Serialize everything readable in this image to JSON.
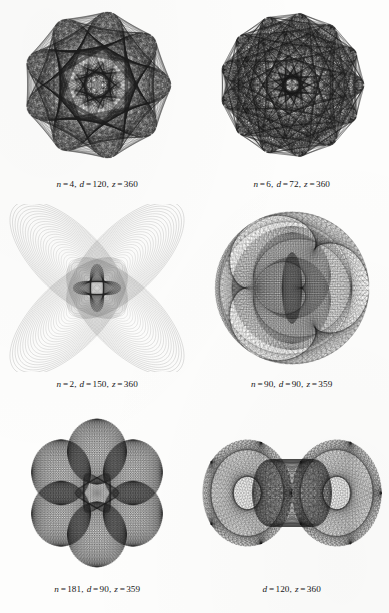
{
  "page": {
    "kind": "figure-plate",
    "background_color": "#fdfdfc",
    "ink_color": "#1a1a1a",
    "columns": 2,
    "rows": 3
  },
  "figures": [
    {
      "id": "figure-1",
      "name": "nine-petal-rosette",
      "caption_parts": {
        "n_label": "n",
        "n_value": "4",
        "d_label": "d",
        "d_value": "120",
        "z_label": "z",
        "z_value": "360"
      },
      "caption_text": "n = 4,  d = 120,  z = 360",
      "params": {
        "n": 4,
        "d": 120,
        "z": 360
      },
      "render": {
        "type": "spirograph-rose",
        "lobes": 9,
        "steps": 360,
        "radius": 74,
        "inner": 0.34,
        "stroke": "#1e1e1e",
        "stroke_width": 0.33,
        "opacity": 0.55,
        "variant": "petal"
      }
    },
    {
      "id": "figure-2",
      "name": "thirteen-point-star",
      "caption_parts": {
        "n_label": "n",
        "n_value": "6",
        "d_label": "d",
        "d_value": "72",
        "z_label": "z",
        "z_value": "360"
      },
      "caption_text": "n = 6,  d = 72,  z = 360",
      "params": {
        "n": 6,
        "d": 72,
        "z": 360
      },
      "render": {
        "type": "spirograph-star",
        "lobes": 13,
        "steps": 360,
        "radius": 72,
        "inner": 0.3,
        "stroke": "#1c1c1c",
        "stroke_width": 0.3,
        "opacity": 0.5,
        "variant": "spike"
      }
    },
    {
      "id": "figure-3",
      "name": "four-lobe-cross",
      "caption_parts": {
        "n_label": "n",
        "n_value": "2",
        "d_label": "d",
        "d_value": "150",
        "z_label": "z",
        "z_value": "360"
      },
      "caption_text": "n = 2,  d = 150,  z = 360",
      "params": {
        "n": 2,
        "d": 150,
        "z": 360
      },
      "render": {
        "type": "lissajous-lobes",
        "lobes": 4,
        "steps": 300,
        "radius": 80,
        "stroke": "#242424",
        "stroke_width": 0.34,
        "opacity": 0.42,
        "variant": "cross"
      }
    },
    {
      "id": "figure-4",
      "name": "circular-moire-lens",
      "caption_parts": {
        "n_label": "n",
        "n_value": "90",
        "d_label": "d",
        "d_value": "90",
        "z_label": "z",
        "z_value": "359"
      },
      "caption_text": "n = 90,  d = 90,  z = 359",
      "params": {
        "n": 90,
        "d": 90,
        "z": 359
      },
      "render": {
        "type": "moire-disc",
        "steps": 359,
        "radius": 77,
        "stroke": "#202020",
        "stroke_width": 0.3,
        "opacity": 0.34,
        "variant": "lens"
      }
    },
    {
      "id": "figure-5",
      "name": "six-lobe-flower",
      "caption_parts": {
        "n_label": "n",
        "n_value": "181",
        "d_label": "d",
        "d_value": "90",
        "z_label": "z",
        "z_value": "359"
      },
      "caption_text": "n = 181,  d = 90,  z = 359",
      "params": {
        "n": 181,
        "d": 90,
        "z": 359
      },
      "render": {
        "type": "petal-cluster",
        "lobes": 6,
        "steps": 359,
        "radius": 74,
        "stroke": "#1f1f1f",
        "stroke_width": 0.33,
        "opacity": 0.4,
        "variant": "flower"
      }
    },
    {
      "id": "figure-6",
      "name": "bowtie-hourglass",
      "caption_parts": {
        "n_label": "",
        "n_value": "",
        "d_label": "d",
        "d_value": "120",
        "z_label": "z",
        "z_value": "360"
      },
      "caption_text": "d = 120,  z = 360",
      "params": {
        "d": 120,
        "z": 360
      },
      "render": {
        "type": "bowtie",
        "steps": 360,
        "radius": 86,
        "stroke": "#212121",
        "stroke_width": 0.34,
        "opacity": 0.38,
        "variant": "hourglass"
      }
    }
  ]
}
